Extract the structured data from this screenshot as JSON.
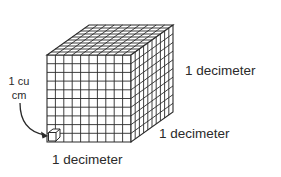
{
  "diagram": {
    "grid_divisions": 10,
    "labels": {
      "unit_cube_line1": "1 cu",
      "unit_cube_line2": "cm",
      "height": "1 decimeter",
      "depth": "1 decimeter",
      "width": "1 decimeter"
    },
    "colors": {
      "line": "#2a2a2a",
      "background": "#ffffff"
    }
  }
}
